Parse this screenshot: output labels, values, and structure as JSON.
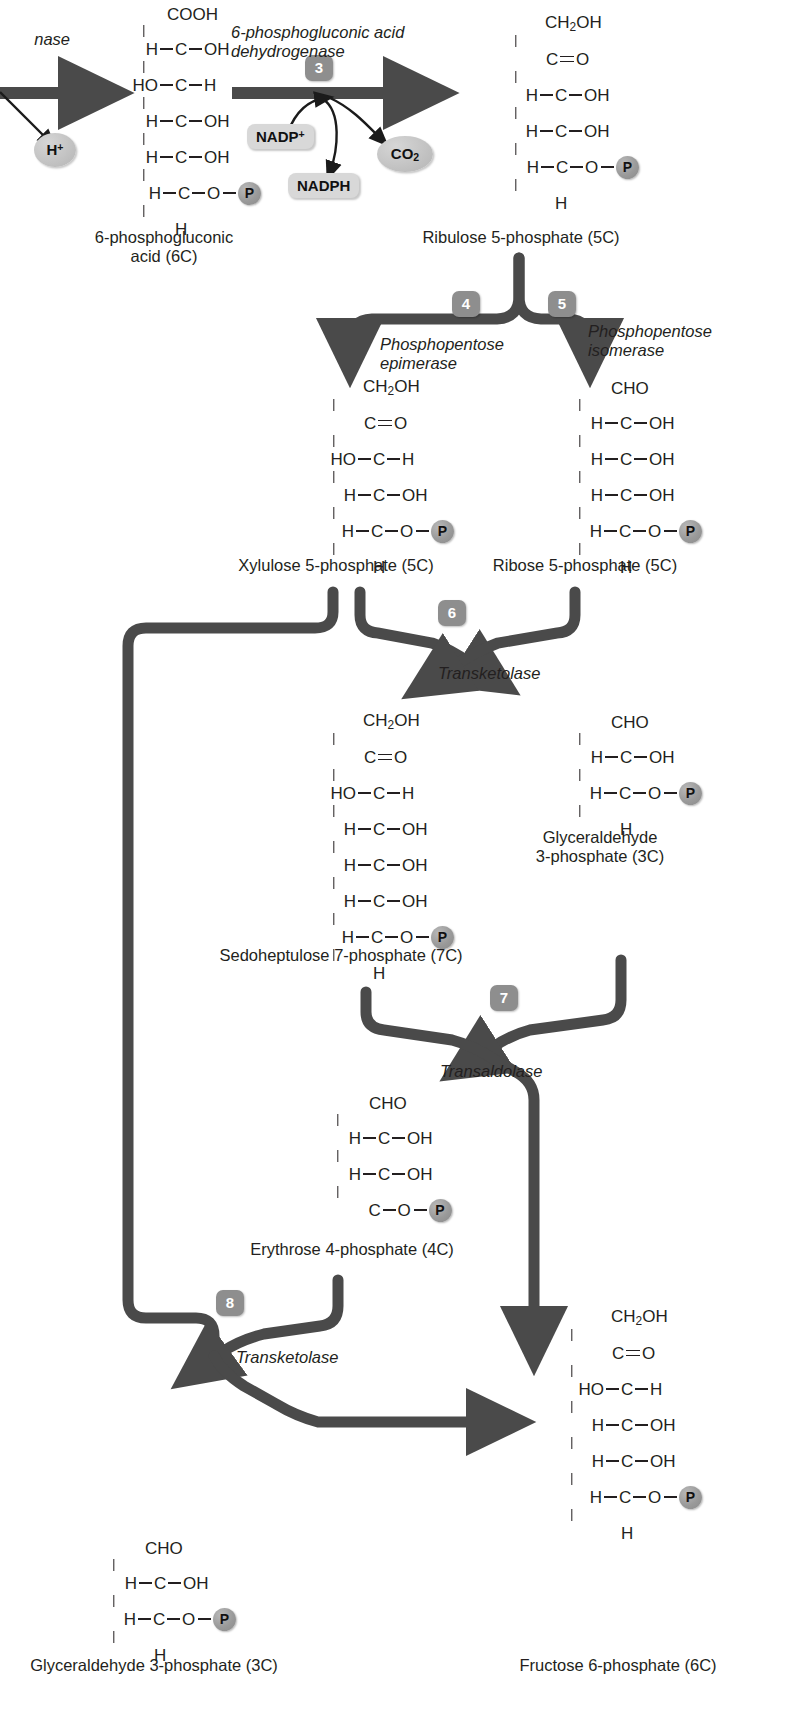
{
  "diagram": {
    "arrow_color": "#4a4a4a",
    "badge_color": "#8e8e8e",
    "phosphate_color": "#9a9a9a",
    "cofactor_color": "#d8d8d8",
    "text_color": "#231f20"
  },
  "steps": [
    {
      "id": "3",
      "number": "3",
      "enzyme": "6-phosphogluconic acid\ndehydrogenase"
    },
    {
      "id": "4",
      "number": "4",
      "enzyme": "Phosphopentose\nepimerase"
    },
    {
      "id": "5",
      "number": "5",
      "enzyme": "Phosphopentose\nisomerase"
    },
    {
      "id": "6",
      "number": "6",
      "enzyme": "Transketolase"
    },
    {
      "id": "7",
      "number": "7",
      "enzyme": "Transaldolase"
    },
    {
      "id": "8",
      "number": "8",
      "enzyme": "Transketolase"
    }
  ],
  "partial_left": {
    "enzyme_tail": "nase"
  },
  "cofactors": {
    "h_plus": "H+",
    "nadp_plus": "NADP+",
    "nadph": "NADPH",
    "co2": "CO2"
  },
  "compounds": {
    "gluconic": {
      "label": "6-phosphogluconic\nacid (6C)",
      "carbons": 6,
      "rows": [
        {
          "left": "",
          "center": "COOH",
          "right": ""
        },
        {
          "left": "H",
          "center": "C",
          "right": "OH"
        },
        {
          "left": "HO",
          "center": "C",
          "right": "H"
        },
        {
          "left": "H",
          "center": "C",
          "right": "OH"
        },
        {
          "left": "H",
          "center": "C",
          "right": "OH"
        },
        {
          "left": "H",
          "center": "C",
          "right": "O-P"
        },
        {
          "left": "",
          "center": "H",
          "right": ""
        }
      ]
    },
    "ribulose5p": {
      "label": "Ribulose 5-phosphate (5C)",
      "carbons": 5,
      "rows": [
        {
          "left": "",
          "center": "CH2OH",
          "right": ""
        },
        {
          "left": "",
          "center": "C",
          "right": "=O"
        },
        {
          "left": "H",
          "center": "C",
          "right": "OH"
        },
        {
          "left": "H",
          "center": "C",
          "right": "OH"
        },
        {
          "left": "H",
          "center": "C",
          "right": "O-P"
        },
        {
          "left": "",
          "center": "H",
          "right": ""
        }
      ]
    },
    "xylulose5p": {
      "label": "Xylulose 5-phosphate (5C)",
      "carbons": 5,
      "rows": [
        {
          "left": "",
          "center": "CH2OH",
          "right": ""
        },
        {
          "left": "",
          "center": "C",
          "right": "=O"
        },
        {
          "left": "HO",
          "center": "C",
          "right": "H"
        },
        {
          "left": "H",
          "center": "C",
          "right": "OH"
        },
        {
          "left": "H",
          "center": "C",
          "right": "O-P"
        },
        {
          "left": "",
          "center": "H",
          "right": ""
        }
      ]
    },
    "ribose5p": {
      "label": "Ribose 5-phosphate (5C)",
      "carbons": 5,
      "rows": [
        {
          "left": "",
          "center": "CHO",
          "right": ""
        },
        {
          "left": "H",
          "center": "C",
          "right": "OH"
        },
        {
          "left": "H",
          "center": "C",
          "right": "OH"
        },
        {
          "left": "H",
          "center": "C",
          "right": "OH"
        },
        {
          "left": "H",
          "center": "C",
          "right": "O-P"
        },
        {
          "left": "",
          "center": "H",
          "right": ""
        }
      ]
    },
    "sedoheptulose7p": {
      "label": "Sedoheptulose 7-phosphate (7C)",
      "carbons": 7,
      "rows": [
        {
          "left": "",
          "center": "CH2OH",
          "right": ""
        },
        {
          "left": "",
          "center": "C",
          "right": "=O"
        },
        {
          "left": "HO",
          "center": "C",
          "right": "H"
        },
        {
          "left": "H",
          "center": "C",
          "right": "OH"
        },
        {
          "left": "H",
          "center": "C",
          "right": "OH"
        },
        {
          "left": "H",
          "center": "C",
          "right": "OH"
        },
        {
          "left": "H",
          "center": "C",
          "right": "O-P"
        },
        {
          "left": "",
          "center": "H",
          "right": ""
        }
      ]
    },
    "g3p_top": {
      "label": "Glyceraldehyde\n3-phosphate (3C)",
      "carbons": 3,
      "rows": [
        {
          "left": "",
          "center": "CHO",
          "right": ""
        },
        {
          "left": "H",
          "center": "C",
          "right": "OH"
        },
        {
          "left": "H",
          "center": "C",
          "right": "O-P"
        },
        {
          "left": "",
          "center": "H",
          "right": ""
        }
      ]
    },
    "erythrose4p": {
      "label": "Erythrose 4-phosphate (4C)",
      "carbons": 4,
      "rows": [
        {
          "left": "",
          "center": "CHO",
          "right": ""
        },
        {
          "left": "H",
          "center": "C",
          "right": "OH"
        },
        {
          "left": "H",
          "center": "C",
          "right": "OH"
        },
        {
          "left": "",
          "center": "C",
          "right": "O-P"
        }
      ]
    },
    "g3p_bottom": {
      "label": "Glyceraldehyde 3-phosphate (3C)",
      "carbons": 3,
      "rows": [
        {
          "left": "",
          "center": "CHO",
          "right": ""
        },
        {
          "left": "H",
          "center": "C",
          "right": "OH"
        },
        {
          "left": "H",
          "center": "C",
          "right": "O-P"
        },
        {
          "left": "",
          "center": "H",
          "right": ""
        }
      ]
    },
    "fructose6p": {
      "label": "Fructose 6-phosphate (6C)",
      "carbons": 6,
      "rows": [
        {
          "left": "",
          "center": "CH2OH",
          "right": ""
        },
        {
          "left": "",
          "center": "C",
          "right": "=O"
        },
        {
          "left": "HO",
          "center": "C",
          "right": "H"
        },
        {
          "left": "H",
          "center": "C",
          "right": "OH"
        },
        {
          "left": "H",
          "center": "C",
          "right": "OH"
        },
        {
          "left": "H",
          "center": "C",
          "right": "O-P"
        },
        {
          "left": "",
          "center": "H",
          "right": ""
        }
      ]
    }
  }
}
